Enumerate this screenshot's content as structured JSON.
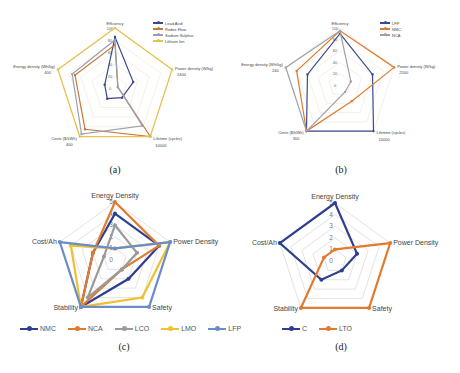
{
  "chart_data": [
    {
      "id": "a",
      "type": "radar",
      "caption": "(a)",
      "axes": [
        "Efficiency",
        "Power density (W/kg)",
        "Lifetime (cycles)",
        "Costs ($/kWh)",
        "Energy density (Wh/kg)"
      ],
      "axis_max_labels": [
        "100",
        "2400",
        "10000",
        "400",
        "400"
      ],
      "radial_ticks": [
        "0",
        "20",
        "40",
        "60",
        "80",
        "100"
      ],
      "range": [
        0,
        100
      ],
      "series": [
        {
          "name": "Lead Acid",
          "color": "#3a4a8c",
          "values": [
            85,
            32,
            20,
            22,
            18
          ]
        },
        {
          "name": "Redox Flow",
          "color": "#c8763a",
          "values": [
            72,
            5,
            100,
            85,
            70
          ]
        },
        {
          "name": "Sodium Sulphur",
          "color": "#9aa0b0",
          "values": [
            80,
            5,
            78,
            95,
            75
          ]
        },
        {
          "name": "Lithium Ion",
          "color": "#e8c04a",
          "values": [
            100,
            100,
            100,
            100,
            100
          ]
        }
      ],
      "legend_position": "top-right"
    },
    {
      "id": "b",
      "type": "radar",
      "caption": "(b)",
      "axes": [
        "Efficiency",
        "Power density (W/kg)",
        "Lifetime (cycles)",
        "Costs ($/kWh)",
        "Energy density (Wh/kg)"
      ],
      "axis_max_labels": [
        "100",
        "2500",
        "10000",
        "300",
        "240"
      ],
      "radial_ticks": [
        "0",
        "20",
        "40",
        "60",
        "80",
        "100"
      ],
      "range": [
        0,
        100
      ],
      "series": [
        {
          "name": "LFP",
          "color": "#3a4a8c",
          "values": [
            90,
            60,
            100,
            100,
            60
          ]
        },
        {
          "name": "NMC",
          "color": "#e07b30",
          "values": [
            95,
            100,
            35,
            100,
            80
          ]
        },
        {
          "name": "NCA",
          "color": "#a0a0a8",
          "values": [
            95,
            20,
            15,
            100,
            100
          ]
        }
      ],
      "legend_position": "top-right"
    },
    {
      "id": "c",
      "type": "radar",
      "caption": "(c)",
      "axes": [
        "Energy Density",
        "Power Density",
        "Safety",
        "Stability",
        "Cost/Ah"
      ],
      "radial_ticks": [
        "0",
        "1",
        "2",
        "3",
        "4",
        "5"
      ],
      "range": [
        0,
        5
      ],
      "series": [
        {
          "name": "NMC",
          "color": "#2f3f8f",
          "values": [
            4,
            4,
            2,
            5,
            2
          ]
        },
        {
          "name": "NCA",
          "color": "#e07b30",
          "values": [
            5,
            4,
            1,
            5,
            2
          ]
        },
        {
          "name": "LCO",
          "color": "#9a9a9a",
          "values": [
            3,
            2,
            1,
            4,
            1
          ]
        },
        {
          "name": "LMO",
          "color": "#f0c030",
          "values": [
            1,
            5,
            4,
            5,
            4
          ]
        },
        {
          "name": "LFP",
          "color": "#6a8cc8",
          "values": [
            1,
            5,
            5,
            5,
            5
          ]
        }
      ],
      "legend_position": "bottom"
    },
    {
      "id": "d",
      "type": "radar",
      "caption": "(d)",
      "axes": [
        "Energy Density",
        "Power Density",
        "Safety",
        "Stability",
        "Cost/Ah"
      ],
      "radial_ticks": [
        "0",
        "1",
        "2",
        "3",
        "4",
        "5"
      ],
      "range": [
        0,
        5
      ],
      "series": [
        {
          "name": "C",
          "color": "#2f3f8f",
          "values": [
            5,
            2,
            1,
            2,
            5
          ]
        },
        {
          "name": "LTO",
          "color": "#e07b30",
          "values": [
            1,
            5,
            5,
            5,
            1
          ]
        }
      ],
      "legend_position": "bottom"
    }
  ]
}
